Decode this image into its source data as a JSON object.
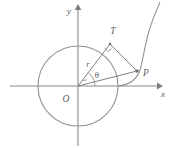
{
  "figure": {
    "background_color": "#ffffff",
    "line_color": "#8a8a8a",
    "label_color": "#5d5d5d",
    "labels": {
      "x_axis": "x",
      "y_axis": "y",
      "origin": "O",
      "tangent_point": "T",
      "curve_point": "P",
      "radius": "r",
      "angle": "θ"
    },
    "geometry": {
      "origin_px": [
        78,
        86
      ],
      "circle_radius_px": 40,
      "tangent_point_px": [
        110,
        44
      ],
      "curve_point_px": [
        137,
        71
      ],
      "angle_degrees": 53,
      "x_axis_span_px": [
        10,
        160
      ],
      "y_axis_span_px": [
        4,
        146
      ]
    }
  }
}
